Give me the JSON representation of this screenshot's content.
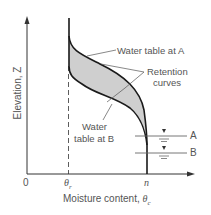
{
  "diagram": {
    "type": "soil-moisture-retention",
    "y_axis": {
      "label": "Elevation, Z"
    },
    "x_axis": {
      "label_prefix": "Moisture content, ",
      "label_symbol": "θ",
      "label_sub": "c"
    },
    "ticks": {
      "origin": "0",
      "theta_r": {
        "symbol": "θ",
        "sub": "r"
      },
      "n": "n"
    },
    "annotations": {
      "water_table_a": "Water table at A",
      "retention_line1": "Retention",
      "retention_line2": "curves",
      "water_line1": "Water",
      "water_line2": "table at B"
    },
    "levels": {
      "a": "A",
      "b": "B"
    },
    "colors": {
      "curve": "#1a1a1a",
      "fill": "#cfcfcf",
      "text": "#555555",
      "axis": "#333333"
    }
  }
}
